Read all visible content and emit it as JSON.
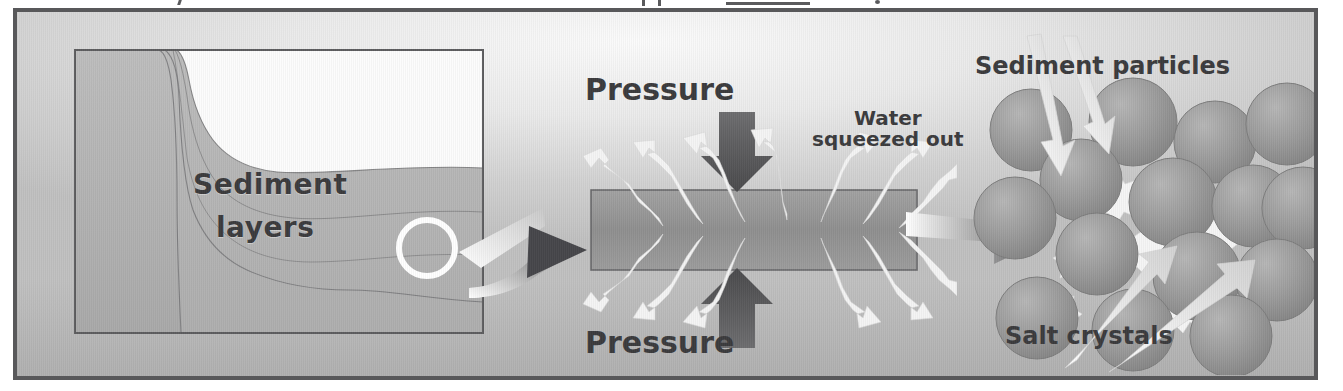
{
  "figure": {
    "kind": "science-diagram",
    "topic": "Formation of sedimentary rock by compaction and cementation",
    "frame_border_color": "#58585a",
    "background_color": "#c6c6c6"
  },
  "panels": {
    "left": {
      "name": "sediment-deposition-cross-section",
      "label_line1": "Sediment",
      "label_line2": "layers",
      "callout": {
        "shape": "circle",
        "name": "magnify-circle",
        "color": "#ffffff"
      },
      "water_fill": "#fbfbfb",
      "layer_colors": [
        "#b3b3b3",
        "#a3a3a3",
        "#9b9b9b",
        "#ababab",
        "#a0a0a0"
      ]
    },
    "middle": {
      "name": "compaction-block",
      "pressure_top_label": "Pressure",
      "pressure_bottom_label": "Pressure",
      "water_label_line1": "Water",
      "water_label_line2": "squeezed out",
      "block_color": "#989898",
      "pressure_arrow_color": "#585858",
      "water_arrow_color": "#f2f2f2",
      "water_arrow_count": 14
    },
    "right": {
      "name": "cementation-particles",
      "sediment_particles_label": "Sediment particles",
      "salt_crystals_label": "Salt crystals",
      "particle_color": "#9a9a9a",
      "crystal_color": "#f4f4f4",
      "particle_count": 15,
      "pointer_arrow_color": "#efefef"
    }
  },
  "connectors": [
    {
      "name": "connector-arrow-left-to-middle",
      "from": "left",
      "to": "middle",
      "style": "curved-gradient-arrow"
    },
    {
      "name": "connector-arrow-middle-to-right",
      "from": "middle",
      "to": "right",
      "style": "curved-gradient-arrow"
    }
  ],
  "cutoff_text_strip": {
    "name": "clipped-caption-above",
    "note": "partial descenders of a line of text cropped at the top edge"
  }
}
